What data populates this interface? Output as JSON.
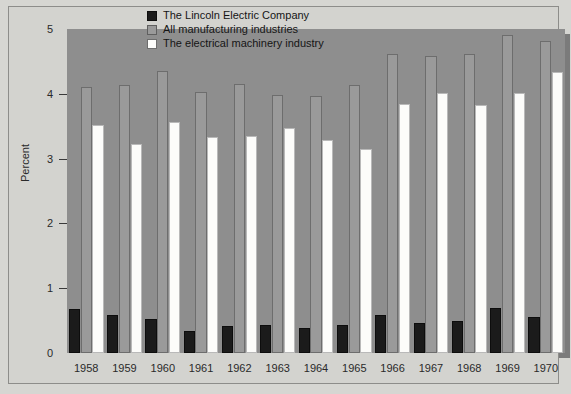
{
  "chart_data": {
    "type": "bar",
    "title": "",
    "xlabel": "",
    "ylabel": "Percent",
    "ylim": [
      0,
      5
    ],
    "yticks": [
      0,
      1,
      2,
      3,
      4,
      5
    ],
    "ytick_labels": [
      "0",
      "1",
      "2",
      "3",
      "4",
      "5"
    ],
    "grid": false,
    "legend_position": "top-center",
    "categories": [
      "1958",
      "1959",
      "1960",
      "1961",
      "1962",
      "1963",
      "1964",
      "1965",
      "1966",
      "1967",
      "1968",
      "1969",
      "1970"
    ],
    "series": [
      {
        "name": "The Lincoln Electric Company",
        "color": "#1b1b1b",
        "values": [
          0.68,
          0.59,
          0.52,
          0.34,
          0.42,
          0.43,
          0.39,
          0.44,
          0.59,
          0.46,
          0.49,
          0.7,
          0.55
        ]
      },
      {
        "name": "All manufacturing industries",
        "color": "#9a9a9a",
        "values": [
          4.11,
          4.13,
          4.35,
          4.03,
          4.15,
          3.98,
          3.97,
          4.13,
          4.62,
          4.59,
          4.62,
          4.91,
          4.81
        ]
      },
      {
        "name": "The electrical machinery industry",
        "color": "#fcfcfa",
        "values": [
          3.52,
          3.22,
          3.56,
          3.34,
          3.35,
          3.47,
          3.29,
          3.15,
          3.84,
          4.02,
          3.82,
          4.01,
          4.33
        ]
      }
    ]
  },
  "axes": {
    "y_label": "Percent"
  }
}
